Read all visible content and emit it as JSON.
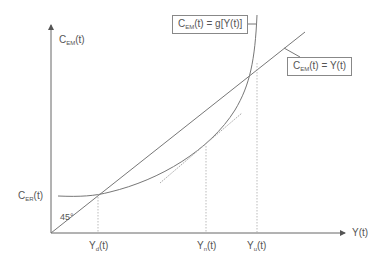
{
  "diagram": {
    "y_axis_label": {
      "main": "C",
      "sub": "EM",
      "rest": "(t)"
    },
    "x_axis_label": "Y(t)",
    "intercept_label": {
      "main": "C",
      "sub": "ER",
      "rest": "(t)"
    },
    "angle_label": "45°",
    "x_ticks": [
      {
        "main": "Y",
        "sub": "d",
        "rest": "(t)"
      },
      {
        "main": "Y",
        "sub": "n",
        "rest": "(t)"
      },
      {
        "main": "Y",
        "sub": "u",
        "rest": "(t)"
      }
    ],
    "callouts": {
      "curve": {
        "main": "C",
        "sub": "EM",
        "rest": "(t) = g[Y(t)]"
      },
      "line": {
        "main": "C",
        "sub": "EM",
        "rest": "(t) = Y(t)"
      }
    }
  },
  "colors": {
    "line": "#777777",
    "dashed": "#aaaaaa",
    "text": "#555555"
  }
}
